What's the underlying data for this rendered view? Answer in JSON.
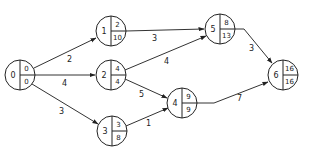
{
  "diagram": {
    "type": "activity-network",
    "nodes": [
      {
        "id": "0",
        "earliest": "0",
        "latest": "0",
        "cx": 20,
        "cy": 75
      },
      {
        "id": "1",
        "earliest": "2",
        "latest": "10",
        "cx": 111,
        "cy": 31
      },
      {
        "id": "2",
        "earliest": "4",
        "latest": "4",
        "cx": 111,
        "cy": 75
      },
      {
        "id": "3",
        "earliest": "3",
        "latest": "8",
        "cx": 112,
        "cy": 131
      },
      {
        "id": "4",
        "earliest": "9",
        "latest": "9",
        "cx": 182,
        "cy": 103
      },
      {
        "id": "5",
        "earliest": "8",
        "latest": "13",
        "cx": 220,
        "cy": 29
      },
      {
        "id": "6",
        "earliest": "16",
        "latest": "16",
        "cx": 283,
        "cy": 75
      }
    ],
    "edges": [
      {
        "from": "0",
        "to": "1",
        "weight": "2"
      },
      {
        "from": "0",
        "to": "2",
        "weight": "4"
      },
      {
        "from": "0",
        "to": "3",
        "weight": "3"
      },
      {
        "from": "1",
        "to": "5",
        "weight": "3"
      },
      {
        "from": "2",
        "to": "5",
        "weight": "4"
      },
      {
        "from": "2",
        "to": "4",
        "weight": "5"
      },
      {
        "from": "3",
        "to": "4",
        "weight": "1"
      },
      {
        "from": "5",
        "to": "6",
        "weight": "3"
      },
      {
        "from": "4",
        "to": "6",
        "weight": "7"
      }
    ]
  },
  "colors": {
    "stroke": "#222222",
    "background": "#ffffff"
  }
}
